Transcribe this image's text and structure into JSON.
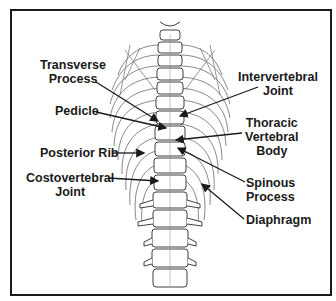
{
  "diagram": {
    "colors": {
      "ink": "#1a1a1a",
      "line": "#555555",
      "background": "#ffffff"
    },
    "labels": [
      {
        "id": "transverse-process",
        "lines": [
          "Transverse",
          "Process"
        ],
        "side": "left"
      },
      {
        "id": "pedicle",
        "lines": [
          "Pedicle"
        ],
        "side": "left"
      },
      {
        "id": "posterior-rib",
        "lines": [
          "Posterior Rib"
        ],
        "side": "left"
      },
      {
        "id": "costovertebral-joint",
        "lines": [
          "Costovertebral",
          "Joint"
        ],
        "side": "left"
      },
      {
        "id": "intervertebral-joint",
        "lines": [
          "Intervertebral",
          "Joint"
        ],
        "side": "right"
      },
      {
        "id": "thoracic-vertebral-body",
        "lines": [
          "Thoracic",
          "Vertebral",
          "Body"
        ],
        "side": "right"
      },
      {
        "id": "spinous-process",
        "lines": [
          "Spinous",
          "Process"
        ],
        "side": "right"
      },
      {
        "id": "diaphragm",
        "lines": [
          "Diaphragm"
        ],
        "side": "right"
      }
    ]
  }
}
